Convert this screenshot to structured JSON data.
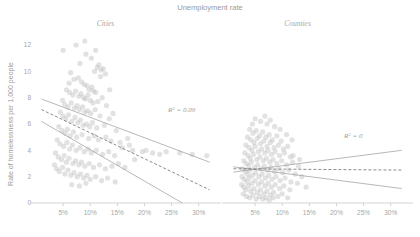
{
  "chart_data": {
    "type": "scatter",
    "title": "Unemployment rate",
    "xlabel": "",
    "ylabel": "Rate of homelessness per 1,000 people",
    "ylim": [
      0,
      13
    ],
    "xlim": [
      0,
      33
    ],
    "grid": false,
    "legend": "none",
    "xtick_labels": [
      "5%",
      "10%",
      "15%",
      "20%",
      "25%",
      "30%"
    ],
    "xtick_values": [
      5,
      10,
      15,
      20,
      25,
      30
    ],
    "ytick_labels": [
      "0",
      "2",
      "4",
      "6",
      "8",
      "10",
      "12"
    ],
    "ytick_values": [
      0,
      2,
      4,
      6,
      8,
      10,
      12
    ],
    "panels": [
      {
        "name": "cities",
        "label": "Cities",
        "r2_label": "R² = 0.09",
        "r2_value": 0.09,
        "fit": {
          "type": "linear-with-bands",
          "center": {
            "x0": 1.0,
            "y0": 7.1,
            "x1": 32.0,
            "y1": 1.0
          },
          "upper": {
            "x0": 1.0,
            "y0": 7.9,
            "x1": 32.0,
            "y1": 3.1
          },
          "lower": {
            "x0": 1.0,
            "y0": 6.2,
            "x1": 32.0,
            "y1": -1.2
          }
        },
        "points": [
          [
            7.4,
            12.0
          ],
          [
            9.2,
            11.3
          ],
          [
            8.1,
            10.6
          ],
          [
            10.2,
            11.0
          ],
          [
            11.3,
            10.3
          ],
          [
            10.8,
            10.0
          ],
          [
            11.6,
            10.5
          ],
          [
            12.0,
            10.1
          ],
          [
            11.9,
            9.6
          ],
          [
            12.4,
            10.2
          ],
          [
            6.4,
            9.9
          ],
          [
            7.0,
            9.4
          ],
          [
            6.1,
            9.1
          ],
          [
            7.8,
            9.5
          ],
          [
            8.4,
            9.2
          ],
          [
            8.9,
            9.0
          ],
          [
            9.4,
            8.9
          ],
          [
            9.8,
            8.6
          ],
          [
            10.3,
            8.8
          ],
          [
            10.6,
            8.5
          ],
          [
            5.6,
            8.6
          ],
          [
            6.2,
            8.4
          ],
          [
            6.8,
            8.2
          ],
          [
            7.3,
            8.5
          ],
          [
            7.9,
            8.1
          ],
          [
            8.3,
            8.3
          ],
          [
            8.8,
            8.0
          ],
          [
            9.1,
            7.9
          ],
          [
            9.6,
            8.2
          ],
          [
            10.0,
            7.8
          ],
          [
            10.5,
            7.6
          ],
          [
            11.0,
            8.4
          ],
          [
            11.4,
            7.7
          ],
          [
            12.2,
            8.0
          ],
          [
            13.0,
            7.4
          ],
          [
            4.9,
            7.8
          ],
          [
            5.3,
            7.5
          ],
          [
            5.9,
            7.3
          ],
          [
            6.5,
            7.6
          ],
          [
            7.1,
            7.2
          ],
          [
            7.6,
            7.4
          ],
          [
            8.0,
            7.1
          ],
          [
            8.6,
            7.3
          ],
          [
            9.0,
            6.9
          ],
          [
            9.5,
            7.0
          ],
          [
            10.1,
            6.8
          ],
          [
            10.9,
            7.1
          ],
          [
            11.8,
            6.6
          ],
          [
            13.5,
            6.4
          ],
          [
            14.2,
            6.8
          ],
          [
            4.5,
            6.9
          ],
          [
            5.0,
            6.6
          ],
          [
            5.5,
            6.4
          ],
          [
            6.0,
            6.7
          ],
          [
            6.6,
            6.2
          ],
          [
            7.2,
            6.5
          ],
          [
            7.7,
            6.1
          ],
          [
            8.2,
            6.3
          ],
          [
            8.7,
            5.9
          ],
          [
            9.3,
            6.0
          ],
          [
            9.9,
            5.8
          ],
          [
            10.4,
            6.1
          ],
          [
            11.2,
            5.7
          ],
          [
            12.6,
            5.9
          ],
          [
            14.8,
            5.5
          ],
          [
            4.2,
            5.8
          ],
          [
            4.8,
            5.5
          ],
          [
            5.4,
            5.3
          ],
          [
            5.8,
            5.6
          ],
          [
            6.3,
            5.1
          ],
          [
            6.9,
            5.4
          ],
          [
            7.5,
            5.0
          ],
          [
            8.5,
            5.2
          ],
          [
            9.7,
            4.9
          ],
          [
            10.7,
            5.1
          ],
          [
            11.5,
            4.8
          ],
          [
            12.9,
            5.0
          ],
          [
            13.8,
            4.7
          ],
          [
            15.5,
            4.6
          ],
          [
            16.9,
            4.9
          ],
          [
            3.9,
            4.8
          ],
          [
            4.4,
            4.5
          ],
          [
            5.1,
            4.3
          ],
          [
            5.7,
            4.6
          ],
          [
            6.2,
            4.1
          ],
          [
            6.7,
            4.4
          ],
          [
            7.4,
            4.0
          ],
          [
            8.1,
            4.2
          ],
          [
            8.9,
            3.9
          ],
          [
            9.6,
            4.1
          ],
          [
            10.2,
            3.8
          ],
          [
            11.1,
            4.0
          ],
          [
            12.3,
            3.7
          ],
          [
            13.4,
            3.9
          ],
          [
            14.5,
            3.6
          ],
          [
            15.9,
            4.2
          ],
          [
            17.8,
            4.0
          ],
          [
            19.6,
            3.9
          ],
          [
            21.5,
            3.8
          ],
          [
            24.0,
            3.9
          ],
          [
            3.6,
            3.8
          ],
          [
            4.1,
            3.5
          ],
          [
            4.7,
            3.3
          ],
          [
            5.2,
            3.6
          ],
          [
            5.6,
            3.1
          ],
          [
            6.1,
            3.4
          ],
          [
            6.8,
            3.0
          ],
          [
            7.3,
            3.2
          ],
          [
            7.9,
            2.9
          ],
          [
            8.4,
            3.1
          ],
          [
            9.0,
            2.8
          ],
          [
            9.8,
            3.0
          ],
          [
            10.6,
            2.7
          ],
          [
            11.7,
            2.9
          ],
          [
            12.8,
            2.6
          ],
          [
            14.0,
            2.8
          ],
          [
            15.2,
            3.0
          ],
          [
            16.4,
            2.7
          ],
          [
            18.2,
            3.3
          ],
          [
            26.5,
            3.8
          ],
          [
            3.4,
            2.9
          ],
          [
            3.8,
            2.6
          ],
          [
            4.3,
            2.4
          ],
          [
            4.9,
            2.7
          ],
          [
            5.3,
            2.2
          ],
          [
            5.9,
            2.5
          ],
          [
            6.4,
            2.1
          ],
          [
            7.0,
            2.3
          ],
          [
            7.6,
            2.0
          ],
          [
            8.2,
            2.2
          ],
          [
            8.8,
            1.9
          ],
          [
            9.4,
            2.1
          ],
          [
            10.0,
            1.8
          ],
          [
            11.0,
            2.0
          ],
          [
            12.1,
            1.7
          ],
          [
            13.2,
            1.9
          ],
          [
            14.6,
            1.6
          ],
          [
            6.6,
            1.4
          ],
          [
            8.0,
            1.3
          ],
          [
            9.2,
            1.5
          ],
          [
            28.8,
            3.7
          ],
          [
            31.5,
            3.6
          ],
          [
            22.8,
            3.7
          ],
          [
            20.3,
            4.0
          ],
          [
            17.2,
            4.4
          ],
          [
            5.0,
            11.6
          ],
          [
            12.8,
            9.8
          ],
          [
            13.6,
            8.6
          ],
          [
            11.0,
            11.6
          ],
          [
            9.0,
            12.3
          ]
        ]
      },
      {
        "name": "counties",
        "label": "Counties",
        "r2_label": "R² = 0",
        "r2_value": 0,
        "fit": {
          "type": "linear-with-bands",
          "center": {
            "x0": 1.0,
            "y0": 2.6,
            "x1": 32.0,
            "y1": 2.5
          },
          "upper": {
            "x0": 1.0,
            "y0": 2.35,
            "x1": 32.0,
            "y1": 4.0
          },
          "lower": {
            "x0": 1.0,
            "y0": 2.75,
            "x1": 32.0,
            "y1": 1.1
          }
        },
        "points": [
          [
            4.0,
            5.6
          ],
          [
            4.6,
            5.3
          ],
          [
            5.2,
            5.5
          ],
          [
            5.8,
            5.1
          ],
          [
            6.4,
            5.4
          ],
          [
            7.0,
            5.0
          ],
          [
            7.6,
            5.2
          ],
          [
            8.2,
            4.8
          ],
          [
            9.0,
            5.1
          ],
          [
            9.8,
            4.7
          ],
          [
            3.6,
            5.0
          ],
          [
            4.2,
            4.8
          ],
          [
            4.8,
            4.6
          ],
          [
            5.4,
            4.9
          ],
          [
            6.0,
            4.5
          ],
          [
            6.6,
            4.7
          ],
          [
            7.2,
            4.3
          ],
          [
            7.8,
            4.6
          ],
          [
            8.5,
            4.2
          ],
          [
            9.3,
            4.4
          ],
          [
            10.2,
            4.1
          ],
          [
            11.0,
            4.3
          ],
          [
            3.3,
            4.4
          ],
          [
            3.9,
            4.2
          ],
          [
            4.4,
            4.0
          ],
          [
            5.0,
            4.3
          ],
          [
            5.6,
            3.9
          ],
          [
            6.2,
            4.1
          ],
          [
            6.8,
            3.8
          ],
          [
            7.4,
            4.0
          ],
          [
            8.0,
            3.7
          ],
          [
            8.7,
            3.9
          ],
          [
            9.5,
            3.6
          ],
          [
            10.4,
            3.8
          ],
          [
            11.5,
            3.5
          ],
          [
            3.1,
            3.8
          ],
          [
            3.7,
            3.6
          ],
          [
            4.1,
            3.4
          ],
          [
            4.7,
            3.7
          ],
          [
            5.3,
            3.3
          ],
          [
            5.9,
            3.5
          ],
          [
            6.5,
            3.2
          ],
          [
            7.1,
            3.4
          ],
          [
            7.7,
            3.1
          ],
          [
            8.3,
            3.3
          ],
          [
            9.0,
            3.0
          ],
          [
            9.9,
            3.2
          ],
          [
            10.8,
            2.9
          ],
          [
            11.9,
            3.1
          ],
          [
            13.0,
            2.8
          ],
          [
            2.9,
            3.2
          ],
          [
            3.4,
            3.0
          ],
          [
            3.8,
            2.8
          ],
          [
            4.3,
            3.1
          ],
          [
            4.9,
            2.7
          ],
          [
            5.5,
            2.9
          ],
          [
            6.1,
            2.6
          ],
          [
            6.7,
            2.8
          ],
          [
            7.3,
            2.5
          ],
          [
            7.9,
            2.7
          ],
          [
            8.6,
            2.4
          ],
          [
            9.4,
            2.6
          ],
          [
            10.1,
            2.3
          ],
          [
            11.2,
            2.5
          ],
          [
            12.4,
            2.2
          ],
          [
            2.7,
            2.6
          ],
          [
            3.2,
            2.4
          ],
          [
            3.6,
            2.2
          ],
          [
            4.0,
            2.5
          ],
          [
            4.5,
            2.1
          ],
          [
            5.1,
            2.3
          ],
          [
            5.7,
            2.0
          ],
          [
            6.3,
            2.2
          ],
          [
            6.9,
            1.9
          ],
          [
            7.5,
            2.1
          ],
          [
            8.1,
            1.8
          ],
          [
            8.8,
            2.0
          ],
          [
            9.6,
            1.7
          ],
          [
            10.5,
            1.9
          ],
          [
            11.6,
            1.6
          ],
          [
            2.6,
            2.0
          ],
          [
            3.0,
            1.8
          ],
          [
            3.5,
            1.6
          ],
          [
            3.9,
            1.9
          ],
          [
            4.4,
            1.5
          ],
          [
            5.0,
            1.7
          ],
          [
            5.6,
            1.4
          ],
          [
            6.2,
            1.6
          ],
          [
            6.8,
            1.3
          ],
          [
            7.4,
            1.5
          ],
          [
            8.0,
            1.2
          ],
          [
            8.7,
            1.4
          ],
          [
            9.5,
            1.1
          ],
          [
            10.3,
            1.3
          ],
          [
            11.4,
            1.0
          ],
          [
            2.5,
            1.4
          ],
          [
            2.9,
            1.2
          ],
          [
            3.3,
            1.0
          ],
          [
            3.8,
            1.3
          ],
          [
            4.2,
            0.9
          ],
          [
            4.8,
            1.1
          ],
          [
            5.4,
            0.8
          ],
          [
            6.0,
            1.0
          ],
          [
            6.6,
            0.7
          ],
          [
            7.2,
            0.9
          ],
          [
            7.8,
            0.6
          ],
          [
            8.4,
            0.8
          ],
          [
            9.2,
            0.5
          ],
          [
            10.0,
            0.7
          ],
          [
            11.0,
            0.4
          ],
          [
            2.8,
            0.7
          ],
          [
            3.4,
            0.5
          ],
          [
            4.0,
            0.4
          ],
          [
            4.6,
            0.6
          ],
          [
            5.2,
            0.3
          ],
          [
            5.8,
            0.5
          ],
          [
            6.4,
            0.3
          ],
          [
            7.0,
            0.4
          ],
          [
            7.6,
            0.2
          ],
          [
            8.3,
            0.4
          ],
          [
            12.8,
            1.5
          ],
          [
            13.6,
            2.0
          ],
          [
            14.4,
            1.2
          ],
          [
            12.0,
            3.6
          ],
          [
            13.2,
            3.3
          ],
          [
            6.0,
            6.2
          ],
          [
            7.2,
            6.0
          ],
          [
            8.6,
            5.8
          ],
          [
            5.0,
            6.4
          ],
          [
            9.6,
            5.6
          ],
          [
            4.5,
            6.0
          ],
          [
            7.8,
            6.3
          ],
          [
            10.8,
            5.2
          ],
          [
            11.8,
            4.8
          ],
          [
            6.8,
            6.6
          ]
        ]
      }
    ]
  }
}
